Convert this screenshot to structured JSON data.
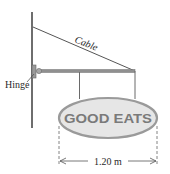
{
  "diagram": {
    "labels": {
      "cable": "Cable",
      "hinge": "Hinge",
      "sign_text": "GOOD EATS",
      "dimension": "1.20 m"
    },
    "colors": {
      "wall": "#6e6e6e",
      "cable": "#555555",
      "rod": "#8f8f8f",
      "hanger": "#6a6a6a",
      "sign_fill": "#e6e6e6",
      "sign_stroke": "#9a9a9a",
      "sign_text": "#7a7a7a",
      "dimension": "#555555"
    }
  }
}
